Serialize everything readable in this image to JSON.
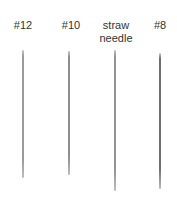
{
  "figure": {
    "needles": [
      {
        "label": "#12",
        "label_x": 23,
        "label_y": 19,
        "x": 23,
        "top": 50,
        "bottom": 178,
        "width": 1.2,
        "color": "#9a9a9a"
      },
      {
        "label": "#10",
        "label_x": 71,
        "label_y": 19,
        "x": 69,
        "top": 51,
        "bottom": 175,
        "width": 1.4,
        "color": "#8e8e8e"
      },
      {
        "label": "straw\nneedle",
        "label_x": 116,
        "label_y": 19,
        "x": 115,
        "top": 50,
        "bottom": 191,
        "width": 1.4,
        "color": "#949494"
      },
      {
        "label": "#8",
        "label_x": 160,
        "label_y": 19,
        "x": 160,
        "top": 53,
        "bottom": 189,
        "width": 1.8,
        "color": "#6e6e6e"
      }
    ]
  }
}
